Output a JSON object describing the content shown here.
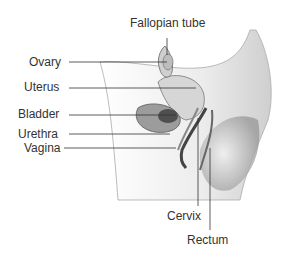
{
  "diagram": {
    "labels": {
      "fallopian_tube": "Fallopian tube",
      "ovary": "Ovary",
      "uterus": "Uterus",
      "bladder": "Bladder",
      "urethra": "Urethra",
      "vagina": "Vagina",
      "cervix": "Cervix",
      "rectum": "Rectum"
    },
    "colors": {
      "line": "#333333",
      "tissue_light": "#e6e6e6",
      "tissue_mid": "#b8b8b8",
      "tissue_dark": "#5a5a5a"
    }
  }
}
